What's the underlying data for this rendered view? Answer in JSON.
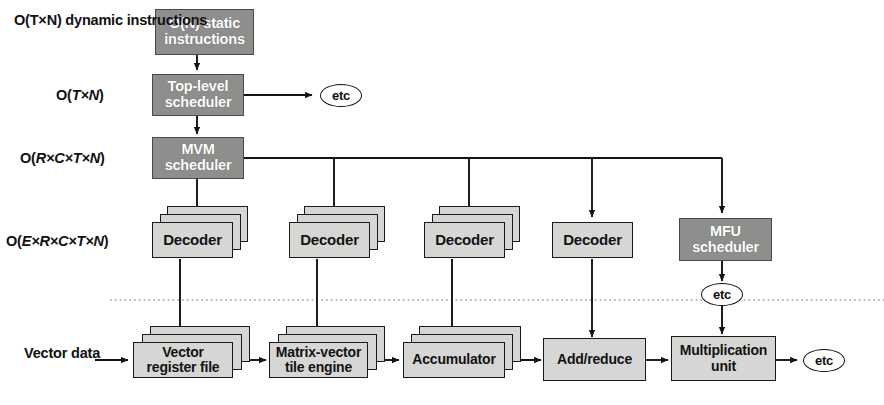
{
  "diagram": {
    "colors": {
      "dark_box": "#8e8e8c",
      "light_box": "#d6d6d4",
      "stroke": "#1a1a1a",
      "background": "#ffffff",
      "dark_box_text": "#ffffff",
      "light_box_text": "#121212"
    },
    "complexity_labels": [
      {
        "id": "dynamic-instructions",
        "line1": "O(T×N) dynamic",
        "line2": "instructions"
      },
      {
        "id": "top-level",
        "text_prefix": "O(",
        "text_italic": "T×N",
        "text_suffix": ")",
        "full": "O(T×N)"
      },
      {
        "id": "mvm",
        "text_prefix": "O(",
        "text_italic": "R×C×T×N",
        "text_suffix": ")",
        "full": "O(R×C×T×N)"
      },
      {
        "id": "decoder",
        "text_prefix": "O(",
        "text_italic": "E×R×C×T×N",
        "text_suffix": ")",
        "full": "O(E×R×C×T×N)"
      }
    ],
    "input_label": {
      "line1": "Vector",
      "line2": "data"
    },
    "scheduler_nodes": [
      {
        "id": "static-instructions",
        "line1": "O(N) static",
        "line2": "instructions",
        "style": "dark"
      },
      {
        "id": "top-level-scheduler",
        "line1": "Top-level",
        "line2": "scheduler",
        "style": "dark"
      },
      {
        "id": "mvm-scheduler",
        "line1": "MVM",
        "line2": "scheduler",
        "style": "dark"
      },
      {
        "id": "mfu-scheduler",
        "line1": "MFU",
        "line2": "scheduler",
        "style": "dark"
      }
    ],
    "decoder_nodes": [
      {
        "id": "decoder-1",
        "label": "Decoder",
        "stacked": true,
        "stack_count": 3
      },
      {
        "id": "decoder-2",
        "label": "Decoder",
        "stacked": true,
        "stack_count": 3
      },
      {
        "id": "decoder-3",
        "label": "Decoder",
        "stacked": true,
        "stack_count": 3
      },
      {
        "id": "decoder-4",
        "label": "Decoder",
        "stacked": false,
        "stack_count": 1
      }
    ],
    "pipeline_nodes": [
      {
        "id": "vector-register-file",
        "line1": "Vector",
        "line2": "register file",
        "stacked": true,
        "stack_count": 3
      },
      {
        "id": "matrix-vector-tile-engine",
        "line1": "Matrix-vector",
        "line2": "tile engine",
        "stacked": true,
        "stack_count": 3
      },
      {
        "id": "accumulator",
        "line1": "Accumulator",
        "line2": "",
        "stacked": true,
        "stack_count": 3
      },
      {
        "id": "add-reduce",
        "line1": "Add/reduce",
        "line2": "",
        "stacked": false,
        "stack_count": 1
      },
      {
        "id": "multiplication-unit",
        "line1": "Multiplication",
        "line2": "unit",
        "stacked": false,
        "stack_count": 1
      }
    ],
    "etc_markers": [
      {
        "id": "etc-top-level",
        "label": "etc"
      },
      {
        "id": "etc-mfu",
        "label": "etc"
      },
      {
        "id": "etc-output",
        "label": "etc"
      }
    ]
  }
}
